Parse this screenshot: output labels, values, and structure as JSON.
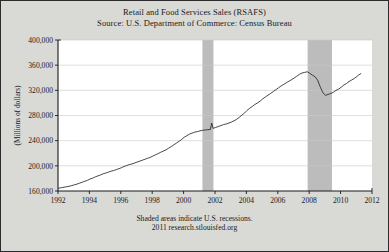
{
  "page": {
    "background_color": "#d9d9d6",
    "border_color": "#2b2b2b",
    "plot_background": "#ffffff"
  },
  "header": {
    "title": "Retail and Food Services Sales (RSAFS)",
    "source": "Source: U.S. Department of Commerce: Census Bureau"
  },
  "footer": {
    "note": "Shaded areas indicate U.S. recessions.",
    "attribution": "2011 research.stlouisfed.org"
  },
  "chart_data": {
    "type": "line",
    "title": "Retail and Food Services Sales (RSAFS)",
    "subtitle": "Source: U.S. Department of Commerce: Census Bureau",
    "xlabel": "",
    "ylabel": "(Millions of dollars)",
    "xlim": [
      1992.0,
      2012.0
    ],
    "ylim": [
      160000,
      400000
    ],
    "grid": true,
    "legend": "none",
    "line_color": "#262626",
    "recession_band_color": "#bcbcbc",
    "xticks": [
      1992,
      1994,
      1996,
      1998,
      2000,
      2002,
      2004,
      2006,
      2008,
      2010,
      2012
    ],
    "xtick_labels": [
      "1992",
      "1994",
      "1996",
      "1998",
      "2000",
      "2002",
      "2004",
      "2006",
      "2008",
      "2010",
      "2012"
    ],
    "yticks": [
      160000,
      200000,
      240000,
      280000,
      320000,
      360000,
      400000
    ],
    "ytick_labels": [
      "160,000",
      "200,000",
      "240,000",
      "280,000",
      "320,000",
      "360,000",
      "400,000"
    ],
    "recessions": [
      {
        "label": "2001 recession",
        "start": 2001.2,
        "end": 2001.9
      },
      {
        "label": "2007-2009 recession",
        "start": 2007.9,
        "end": 2009.45
      }
    ],
    "series": [
      {
        "name": "Retail and Food Services Sales",
        "units": "Millions of dollars",
        "x": [
          1992.04,
          1992.21,
          1992.38,
          1992.54,
          1992.71,
          1992.88,
          1993.04,
          1993.21,
          1993.38,
          1993.54,
          1993.71,
          1993.88,
          1994.04,
          1994.21,
          1994.38,
          1994.54,
          1994.71,
          1994.88,
          1995.04,
          1995.21,
          1995.38,
          1995.54,
          1995.71,
          1995.88,
          1996.04,
          1996.21,
          1996.38,
          1996.54,
          1996.71,
          1996.88,
          1997.04,
          1997.21,
          1997.38,
          1997.54,
          1997.71,
          1997.88,
          1998.04,
          1998.21,
          1998.38,
          1998.54,
          1998.71,
          1998.88,
          1999.04,
          1999.21,
          1999.38,
          1999.54,
          1999.71,
          1999.88,
          2000.04,
          2000.21,
          2000.38,
          2000.54,
          2000.71,
          2000.88,
          2001.04,
          2001.21,
          2001.38,
          2001.54,
          2001.71,
          2001.79,
          2001.88,
          2002.04,
          2002.21,
          2002.38,
          2002.54,
          2002.71,
          2002.88,
          2003.04,
          2003.21,
          2003.38,
          2003.54,
          2003.71,
          2003.88,
          2004.04,
          2004.21,
          2004.38,
          2004.54,
          2004.71,
          2004.88,
          2005.04,
          2005.21,
          2005.38,
          2005.54,
          2005.71,
          2005.88,
          2006.04,
          2006.21,
          2006.38,
          2006.54,
          2006.71,
          2006.88,
          2007.04,
          2007.21,
          2007.38,
          2007.54,
          2007.71,
          2007.88,
          2008.04,
          2008.21,
          2008.38,
          2008.54,
          2008.71,
          2008.88,
          2009.04,
          2009.21,
          2009.38,
          2009.54,
          2009.71,
          2009.88,
          2010.04,
          2010.21,
          2010.38,
          2010.54,
          2010.71,
          2010.88,
          2011.04,
          2011.13,
          2011.29
        ],
        "y": [
          164500,
          165200,
          166000,
          166800,
          167500,
          168600,
          169800,
          171000,
          172500,
          174000,
          175500,
          177000,
          179000,
          180500,
          182500,
          184000,
          185500,
          187500,
          188500,
          190000,
          191500,
          192500,
          194000,
          195500,
          197000,
          199000,
          200500,
          202000,
          203000,
          204500,
          206000,
          207500,
          209000,
          210500,
          212000,
          213500,
          215500,
          217500,
          219500,
          221500,
          223500,
          225500,
          228000,
          230500,
          233500,
          236000,
          239000,
          242000,
          245500,
          248000,
          250500,
          252000,
          253500,
          254500,
          255500,
          256500,
          257000,
          257500,
          257800,
          268000,
          259500,
          261000,
          262500,
          264000,
          265500,
          266500,
          268000,
          269500,
          271500,
          274000,
          277000,
          280500,
          284000,
          288000,
          291500,
          294500,
          297500,
          300000,
          303000,
          306500,
          309500,
          312500,
          315000,
          318000,
          321000,
          324000,
          327000,
          329500,
          332000,
          334500,
          337000,
          339500,
          342500,
          345500,
          347500,
          348500,
          349500,
          347000,
          344000,
          341500,
          336000,
          325000,
          316000,
          312000,
          313500,
          315000,
          317000,
          320000,
          322000,
          325000,
          328500,
          331000,
          334000,
          336500,
          339000,
          342000,
          344000,
          346500
        ]
      }
    ]
  }
}
